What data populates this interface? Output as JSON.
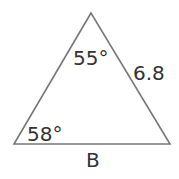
{
  "diagram": {
    "type": "triangle",
    "vertices": {
      "apex": [
        91,
        13
      ],
      "bottom_left": [
        14,
        144
      ],
      "bottom_right": [
        170,
        144
      ]
    },
    "stroke_color": "#777777",
    "text_color": "#333333",
    "labels": {
      "apex_angle": "55°",
      "bottom_left_angle": "58°",
      "right_side": "6.8",
      "base": "B"
    }
  }
}
